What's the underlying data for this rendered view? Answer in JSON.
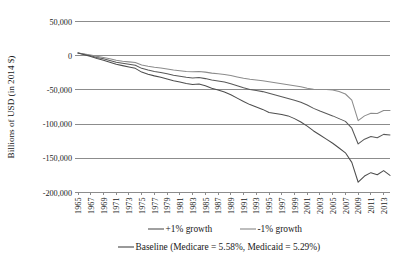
{
  "chart_data": {
    "type": "line",
    "title": "",
    "xlabel": "",
    "ylabel": "Billions of USD (in 2014 $)",
    "grid": "horizontal",
    "legend_position": "bottom",
    "xlim": [
      1965,
      2014
    ],
    "ylim": [
      -200000,
      50000
    ],
    "ytick_labels": [
      "50,000",
      "0",
      "-50,000",
      "-100,000",
      "-150,000",
      "-200,000"
    ],
    "ytick_values": [
      50000,
      0,
      -50000,
      -100000,
      -150000,
      -200000
    ],
    "xtick_labels": [
      "1965",
      "1967",
      "1969",
      "1971",
      "1973",
      "1975",
      "1977",
      "1979",
      "1981",
      "1983",
      "1985",
      "1987",
      "1989",
      "1991",
      "1993",
      "1995",
      "1997",
      "1999",
      "2001",
      "2003",
      "2005",
      "2007",
      "2009",
      "2011",
      "2013"
    ],
    "xtick_values": [
      1965,
      1967,
      1969,
      1971,
      1973,
      1975,
      1977,
      1979,
      1981,
      1983,
      1985,
      1987,
      1989,
      1991,
      1993,
      1995,
      1997,
      1999,
      2001,
      2003,
      2005,
      2007,
      2009,
      2011,
      2013
    ],
    "x": [
      1965,
      1966,
      1967,
      1968,
      1969,
      1970,
      1971,
      1972,
      1973,
      1974,
      1975,
      1976,
      1977,
      1978,
      1979,
      1980,
      1981,
      1982,
      1983,
      1984,
      1985,
      1986,
      1987,
      1988,
      1989,
      1990,
      1991,
      1992,
      1993,
      1994,
      1995,
      1996,
      1997,
      1998,
      1999,
      2000,
      2001,
      2002,
      2003,
      2004,
      2005,
      2006,
      2007,
      2008,
      2009,
      2010,
      2011,
      2012,
      2013,
      2014
    ],
    "series": [
      {
        "name": "+1% growth",
        "color": "#595959",
        "values": [
          4000,
          2000,
          0,
          -2500,
          -4500,
          -7000,
          -9500,
          -11000,
          -12500,
          -14000,
          -18500,
          -21000,
          -23000,
          -24500,
          -26500,
          -28500,
          -30000,
          -31500,
          -32500,
          -32000,
          -33500,
          -35500,
          -37000,
          -38500,
          -41000,
          -44000,
          -47000,
          -49500,
          -51000,
          -52500,
          -55000,
          -57500,
          -60000,
          -62500,
          -65000,
          -68000,
          -72000,
          -77000,
          -81000,
          -84500,
          -88000,
          -92000,
          -96000,
          -106000,
          -129000,
          -122000,
          -118000,
          -120000,
          -115000,
          -116000
        ]
      },
      {
        "name": "-1% growth",
        "color": "#8c8c8c",
        "values": [
          4000,
          2500,
          1000,
          -1000,
          -2500,
          -4500,
          -6500,
          -8000,
          -9000,
          -10000,
          -13500,
          -15500,
          -17000,
          -18000,
          -19500,
          -21000,
          -22000,
          -23000,
          -23500,
          -23000,
          -24000,
          -25500,
          -26500,
          -27500,
          -29000,
          -31000,
          -33000,
          -34500,
          -35500,
          -36500,
          -38000,
          -39500,
          -41000,
          -42500,
          -44000,
          -45500,
          -47500,
          -49000,
          -49500,
          -49500,
          -50000,
          -52500,
          -56000,
          -65000,
          -95000,
          -88000,
          -84000,
          -84500,
          -80000,
          -80000
        ]
      },
      {
        "name": "Baseline (Medicare = 5.58%, Medicaid = 5.29%)",
        "color": "#4d4d4d",
        "values": [
          4000,
          1500,
          -1000,
          -4000,
          -6500,
          -9500,
          -12500,
          -14500,
          -16500,
          -18500,
          -24000,
          -27000,
          -29500,
          -31500,
          -34000,
          -36500,
          -38500,
          -40500,
          -42000,
          -41500,
          -44000,
          -47500,
          -50000,
          -53000,
          -57000,
          -62000,
          -67000,
          -71500,
          -75000,
          -78500,
          -83000,
          -84500,
          -86000,
          -88000,
          -92000,
          -97000,
          -103000,
          -110000,
          -116000,
          -122000,
          -128000,
          -135000,
          -142000,
          -156000,
          -185000,
          -176000,
          -171000,
          -174000,
          -168000,
          -175000
        ]
      }
    ],
    "legend": [
      {
        "label": "+1% growth",
        "color": "#595959"
      },
      {
        "label": "-1% growth",
        "color": "#8c8c8c"
      },
      {
        "label": "Baseline (Medicare = 5.58%, Medicaid = 5.29%)",
        "color": "#4d4d4d"
      }
    ]
  }
}
